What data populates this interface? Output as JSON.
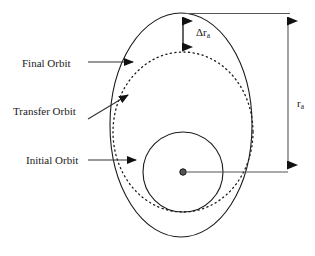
{
  "figure": {
    "background_color": "#ffffff",
    "stroke_color": "#1a1a1a",
    "width": 315,
    "height": 256
  },
  "labels": {
    "final_orbit": "Final Orbit",
    "transfer_orbit": "Transfer Orbit",
    "initial_orbit": "Initial Orbit",
    "delta_ra": "Δr",
    "delta_ra_sub": "a",
    "ra": "r",
    "ra_sub": "a"
  },
  "diagram": {
    "center_body": {
      "name": "central-body",
      "cx": 183,
      "cy": 172,
      "r": 3.2
    },
    "initial_orbit": {
      "shape": "circle",
      "style": "solid",
      "cx": 183,
      "cy": 172,
      "r": 40
    },
    "transfer_orbit": {
      "shape": "ellipse",
      "style": "dotted",
      "cx": 183,
      "cy": 132,
      "rx": 70,
      "ry": 80
    },
    "final_orbit": {
      "shape": "ellipse",
      "style": "solid",
      "cx": 181,
      "cy": 125,
      "rx": 71,
      "ry": 112
    },
    "delta_ra_dimension": {
      "x": 183,
      "y_top": 16,
      "y_bottom": 52,
      "double_headed": true
    },
    "ra_dimension": {
      "x": 288,
      "y_top": 14,
      "y_bottom": 172,
      "double_headed": true,
      "extension_top_y": 13,
      "extension_bottom_y": 172
    },
    "leaders": [
      {
        "name": "final-orbit-leader",
        "from_x": 88,
        "from_y": 62,
        "to_x": 140,
        "to_y": 62,
        "arrow": "right"
      },
      {
        "name": "transfer-orbit-leader",
        "from_x": 88,
        "from_y": 118,
        "to_x": 133,
        "to_y": 92,
        "arrow": "up-right"
      },
      {
        "name": "initial-orbit-leader",
        "from_x": 88,
        "from_y": 160,
        "to_x": 143,
        "to_y": 160,
        "arrow": "right"
      }
    ]
  }
}
